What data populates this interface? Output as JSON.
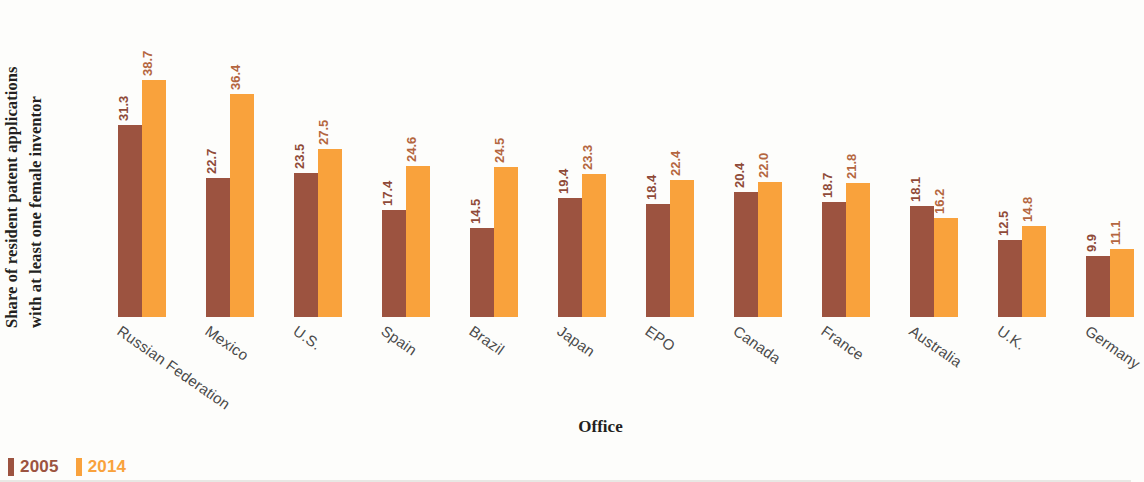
{
  "chart_data": {
    "type": "bar",
    "title": "",
    "xlabel": "Office",
    "ylabel_line1": "Share of resident patent applications",
    "ylabel_line2": "with at least one female inventor",
    "categories": [
      "Russian Federation",
      "Mexico",
      "U.S.",
      "Spain",
      "Brazil",
      "Japan",
      "EPO",
      "Canada",
      "France",
      "Australia",
      "U.K.",
      "Germany"
    ],
    "series": [
      {
        "name": "2005",
        "color": "#9c5340",
        "values": [
          31.3,
          22.7,
          23.5,
          17.4,
          14.5,
          19.4,
          18.4,
          20.4,
          18.7,
          18.1,
          12.5,
          9.9
        ]
      },
      {
        "name": "2014",
        "color": "#f9a23c",
        "values": [
          38.7,
          36.4,
          27.5,
          24.6,
          24.5,
          23.3,
          22.4,
          22.0,
          21.8,
          16.2,
          14.8,
          11.1
        ]
      }
    ],
    "ylim": [
      0,
      40
    ],
    "grid": false,
    "legend_position": "bottom-left",
    "data_labels_shown": true
  },
  "legend": {
    "items": [
      {
        "label": "2005",
        "color": "#9c5340"
      },
      {
        "label": "2014",
        "color": "#f9a23c"
      }
    ]
  },
  "axis": {
    "x_title": "Office"
  }
}
